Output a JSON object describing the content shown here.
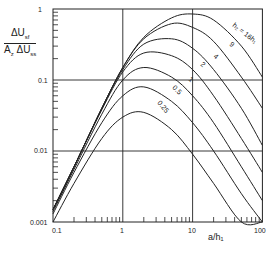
{
  "chart_data": {
    "type": "line",
    "title": "",
    "xlabel": "a/h1",
    "ylabel": "ΔU_sf / (A_z ΔU_ss)",
    "xscale": "log",
    "yscale": "log",
    "xlim": [
      0.1,
      100
    ],
    "ylim": [
      0.001,
      1
    ],
    "x_ticks": [
      "0.1",
      "1",
      "10",
      "100"
    ],
    "y_ticks": [
      "0.001",
      "0.01",
      "0.1",
      "1"
    ],
    "grid": true,
    "x": [
      0.1,
      0.2,
      0.5,
      1,
      2,
      5,
      10,
      20,
      50,
      100
    ],
    "series": [
      {
        "name": "h2 = 16h1",
        "label": "h₂ = 16h₁",
        "values": [
          0.0015,
          0.006,
          0.04,
          0.15,
          0.4,
          0.75,
          0.85,
          0.7,
          0.3,
          0.11
        ]
      },
      {
        "name": "9",
        "label": "9",
        "values": [
          0.0015,
          0.006,
          0.04,
          0.15,
          0.38,
          0.62,
          0.55,
          0.35,
          0.11,
          0.04
        ]
      },
      {
        "name": "4",
        "label": "4",
        "values": [
          0.0015,
          0.006,
          0.04,
          0.14,
          0.32,
          0.38,
          0.28,
          0.14,
          0.04,
          0.012
        ]
      },
      {
        "name": "2",
        "label": "2",
        "values": [
          0.0015,
          0.006,
          0.038,
          0.13,
          0.24,
          0.22,
          0.14,
          0.06,
          0.015,
          0.005
        ]
      },
      {
        "name": "1",
        "label": "1",
        "values": [
          0.0014,
          0.0055,
          0.033,
          0.1,
          0.15,
          0.11,
          0.06,
          0.025,
          0.006,
          0.002
        ]
      },
      {
        "name": "0.5",
        "label": "0.5",
        "values": [
          0.0013,
          0.005,
          0.025,
          0.06,
          0.08,
          0.05,
          0.025,
          0.01,
          0.0025,
          0.001
        ]
      },
      {
        "name": "0.25",
        "label": "0.25",
        "values": [
          0.001,
          0.0035,
          0.015,
          0.03,
          0.035,
          0.02,
          0.009,
          0.0035,
          0.001,
          0.0004
        ]
      }
    ]
  },
  "labels": {
    "y_num": "ΔU",
    "y_num_sub": "sf",
    "y_den": "A",
    "y_den_sub": "z",
    "y_den2": "ΔU",
    "y_den2_sub": "ss",
    "x_axis": "a/h₁",
    "tick_y1": "1",
    "tick_y01": "0.1",
    "tick_y001": "0.01",
    "tick_y0001": "0.001",
    "tick_x01": "0.1",
    "tick_x1": "1",
    "tick_x10": "10",
    "tick_x100": "100"
  }
}
